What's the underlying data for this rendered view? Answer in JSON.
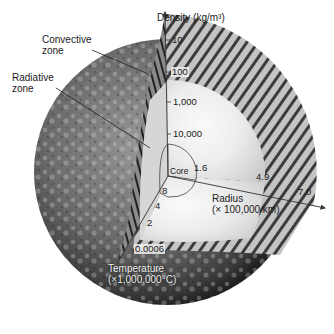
{
  "diagram": {
    "axes": {
      "density": {
        "label": "Density (kg/m³)",
        "ticks": [
          "10",
          "100",
          "1,000",
          "10,000"
        ]
      },
      "radius": {
        "label_line1": "Radius",
        "label_line2": "(× 100,000 km)",
        "ticks": [
          "1.6",
          "4.9",
          "7.0"
        ]
      },
      "temperature": {
        "label_line1": "Temperature",
        "label_line2": "(×1,000,000°C)",
        "ticks": [
          "8",
          "4",
          "2",
          "0.0006"
        ]
      }
    },
    "zones": {
      "convective_line1": "Convective",
      "convective_line2": "zone",
      "radiative_line1": "Radiative",
      "radiative_line2": "zone",
      "core": "Core"
    },
    "colors": {
      "surface_dark": "#2b2b2b",
      "surface_mid": "#6a6a6a",
      "interior_light": "#e6e6e6",
      "convective_band": "#bdbdbd",
      "axis_line": "#333333",
      "background": "#ffffff"
    }
  }
}
